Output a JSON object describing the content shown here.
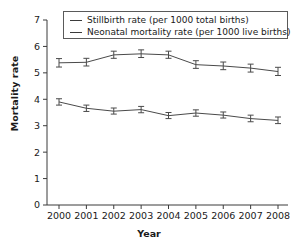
{
  "chart_data": {
    "type": "line",
    "title": "",
    "xlabel": "Year",
    "ylabel": "Mortality rate",
    "x": [
      2000,
      2001,
      2002,
      2003,
      2004,
      2005,
      2006,
      2007,
      2008
    ],
    "xtick_labels": [
      "2000",
      "2001",
      "2002",
      "2003",
      "2004",
      "2005",
      "2006",
      "2007",
      "2008"
    ],
    "ytick_labels": [
      "0",
      "1",
      "2",
      "3",
      "4",
      "5",
      "6",
      "7"
    ],
    "ylim": [
      0,
      7
    ],
    "xlim": [
      2000,
      2008
    ],
    "grid": false,
    "legend_position": "top-center",
    "error_bars": true,
    "series": [
      {
        "name": "Stillbirth rate (per 1000 total births)",
        "color": "#4a4a4a",
        "values": [
          5.38,
          5.4,
          5.68,
          5.72,
          5.68,
          5.31,
          5.26,
          5.18,
          5.05
        ],
        "err_low": [
          5.22,
          5.26,
          5.55,
          5.58,
          5.55,
          5.17,
          5.12,
          5.03,
          4.9
        ],
        "err_high": [
          5.54,
          5.55,
          5.82,
          5.87,
          5.82,
          5.46,
          5.41,
          5.33,
          5.21
        ]
      },
      {
        "name": "Neonatal mortality rate (per 1000 live births)",
        "color": "#4a4a4a",
        "values": [
          3.9,
          3.66,
          3.55,
          3.61,
          3.38,
          3.48,
          3.4,
          3.27,
          3.2
        ],
        "err_low": [
          3.78,
          3.54,
          3.44,
          3.49,
          3.27,
          3.36,
          3.29,
          3.15,
          3.08
        ],
        "err_high": [
          4.02,
          3.78,
          3.67,
          3.73,
          3.5,
          3.6,
          3.52,
          3.4,
          3.33
        ]
      }
    ]
  },
  "legend": {
    "items": [
      {
        "label": "Stillbirth rate (per 1000 total births)"
      },
      {
        "label": "Neonatal mortality rate (per 1000 live births)"
      }
    ]
  },
  "axes": {
    "y_title": "Mortality rate",
    "x_title": "Year"
  }
}
